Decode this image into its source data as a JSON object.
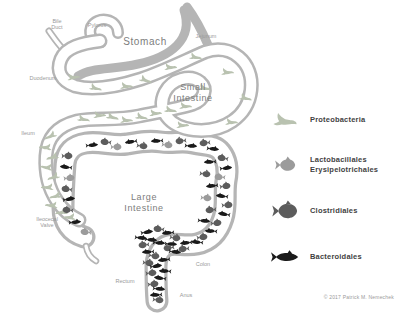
{
  "colors": {
    "tube_wall": "#b5b5b5",
    "label_text": "#9a9a9a",
    "organ_text": "#7d7d7d",
    "legend_text": "#3f3f3f"
  },
  "copyright": "© 2017 Patrick M. Nemechek",
  "legend": {
    "items": [
      {
        "id": "proteobacteria",
        "glyph": "bird",
        "color": "#b9c2b0",
        "label": "Proteobacteria"
      },
      {
        "id": "lactobacillales",
        "glyph": "fish-round",
        "color": "#9b9b9b",
        "label": "Lactobacillales\nErysipelotrichales"
      },
      {
        "id": "clostridiales",
        "glyph": "fish-round",
        "color": "#5c5c5c",
        "label": "Clostridiales"
      },
      {
        "id": "bacteroidales",
        "glyph": "fish-sleek",
        "color": "#1a1a1a",
        "label": "Bacteroidales"
      }
    ]
  },
  "labels": [
    {
      "name": "bile-duct",
      "cls": "anatomy",
      "fs": 5.5,
      "x": 57,
      "y": 23,
      "lines": [
        "Bile",
        "Duct"
      ]
    },
    {
      "name": "pylorus",
      "cls": "anatomy",
      "fs": 5.5,
      "x": 97,
      "y": 27,
      "lines": [
        "Pylorus"
      ]
    },
    {
      "name": "jejunum",
      "cls": "anatomy",
      "fs": 5.5,
      "x": 206,
      "y": 38,
      "lines": [
        "Jejunum"
      ]
    },
    {
      "name": "duodenum",
      "cls": "anatomy",
      "fs": 5.5,
      "x": 43,
      "y": 80,
      "lines": [
        "Duodenum"
      ]
    },
    {
      "name": "ileum",
      "cls": "anatomy",
      "fs": 5.5,
      "x": 28,
      "y": 135,
      "lines": [
        "Ileum"
      ]
    },
    {
      "name": "ileocecal-valve",
      "cls": "anatomy",
      "fs": 5.5,
      "x": 47,
      "y": 221,
      "lines": [
        "Ileocecal",
        "Valve"
      ]
    },
    {
      "name": "rectum",
      "cls": "anatomy",
      "fs": 5.5,
      "x": 125,
      "y": 283,
      "lines": [
        "Rectum"
      ]
    },
    {
      "name": "colon",
      "cls": "anatomy",
      "fs": 5.5,
      "x": 203,
      "y": 266,
      "lines": [
        "Colon"
      ]
    },
    {
      "name": "anus",
      "cls": "anatomy",
      "fs": 5.5,
      "x": 186,
      "y": 297,
      "lines": [
        "Anus"
      ]
    },
    {
      "name": "stomach",
      "cls": "organ",
      "fs": 10,
      "x": 145,
      "y": 45,
      "lines": [
        "Stomach"
      ]
    },
    {
      "name": "small-intestine",
      "cls": "organ",
      "fs": 9,
      "x": 193,
      "y": 90,
      "lines": [
        "Small",
        "Intestine"
      ]
    },
    {
      "name": "large-intestine",
      "cls": "organ",
      "fs": 9,
      "x": 144,
      "y": 200,
      "lines": [
        "Large",
        "Intestine"
      ]
    }
  ],
  "markers": [
    {
      "t": "p",
      "x": 74,
      "y": 77,
      "r": -12
    },
    {
      "t": "p",
      "x": 96,
      "y": 88,
      "r": 8
    },
    {
      "t": "p",
      "x": 127,
      "y": 86,
      "r": -5
    },
    {
      "t": "p",
      "x": 146,
      "y": 80,
      "r": 14
    },
    {
      "t": "p",
      "x": 171,
      "y": 67,
      "r": -8
    },
    {
      "t": "p",
      "x": 196,
      "y": 57,
      "r": 4
    },
    {
      "t": "p",
      "x": 228,
      "y": 72,
      "r": -6
    },
    {
      "t": "p",
      "x": 246,
      "y": 98,
      "r": 8
    },
    {
      "t": "p",
      "x": 232,
      "y": 122,
      "r": -5
    },
    {
      "t": "p",
      "x": 205,
      "y": 88,
      "r": 6
    },
    {
      "t": "p",
      "x": 183,
      "y": 125,
      "r": -8
    },
    {
      "t": "p",
      "x": 84,
      "y": 119,
      "r": 6
    },
    {
      "t": "p",
      "x": 100,
      "y": 115,
      "r": -8
    },
    {
      "t": "p",
      "x": 113,
      "y": 117,
      "r": 10
    },
    {
      "t": "p",
      "x": 127,
      "y": 120,
      "r": -5
    },
    {
      "t": "p",
      "x": 142,
      "y": 117,
      "r": 7
    },
    {
      "t": "p",
      "x": 156,
      "y": 113,
      "r": -9
    },
    {
      "t": "p",
      "x": 171,
      "y": 110,
      "r": 5
    },
    {
      "t": "p",
      "x": 186,
      "y": 106,
      "r": -5
    },
    {
      "t": "p",
      "x": 50,
      "y": 136,
      "r": -18,
      "f": 1
    },
    {
      "t": "p",
      "x": 45,
      "y": 147,
      "r": 10,
      "f": 1
    },
    {
      "t": "p",
      "x": 52,
      "y": 157,
      "r": -10,
      "f": 1
    },
    {
      "t": "p",
      "x": 46,
      "y": 167,
      "r": 14,
      "f": 1
    },
    {
      "t": "p",
      "x": 53,
      "y": 177,
      "r": -14,
      "f": 1
    },
    {
      "t": "p",
      "x": 47,
      "y": 187,
      "r": 8,
      "f": 1
    },
    {
      "t": "p",
      "x": 55,
      "y": 196,
      "r": -8,
      "f": 1
    },
    {
      "t": "p",
      "x": 51,
      "y": 205,
      "r": 10,
      "f": 1
    },
    {
      "t": "p",
      "x": 61,
      "y": 212,
      "r": -5,
      "f": 1
    },
    {
      "t": "p",
      "x": 69,
      "y": 217,
      "r": 6,
      "f": 1
    },
    {
      "t": "c",
      "x": 68,
      "y": 156,
      "r": 0
    },
    {
      "t": "b",
      "x": 65,
      "y": 167,
      "r": 6,
      "f": 1
    },
    {
      "t": "l",
      "x": 70,
      "y": 178,
      "r": -6
    },
    {
      "t": "c",
      "x": 66,
      "y": 189,
      "r": 8,
      "f": 1
    },
    {
      "t": "b",
      "x": 70,
      "y": 199,
      "r": -8
    },
    {
      "t": "c",
      "x": 67,
      "y": 210,
      "r": 5,
      "f": 1
    },
    {
      "t": "b",
      "x": 76,
      "y": 222,
      "r": -5
    },
    {
      "t": "l",
      "x": 85,
      "y": 232,
      "r": 6,
      "f": 1
    },
    {
      "t": "b",
      "x": 93,
      "y": 145,
      "r": -5
    },
    {
      "t": "c",
      "x": 105,
      "y": 142,
      "r": 6,
      "f": 1
    },
    {
      "t": "l",
      "x": 117,
      "y": 147,
      "r": 0
    },
    {
      "t": "b",
      "x": 130,
      "y": 142,
      "r": -8,
      "f": 1
    },
    {
      "t": "c",
      "x": 143,
      "y": 146,
      "r": 6
    },
    {
      "t": "b",
      "x": 156,
      "y": 141,
      "r": -4,
      "f": 1
    },
    {
      "t": "l",
      "x": 168,
      "y": 145,
      "r": 5
    },
    {
      "t": "c",
      "x": 180,
      "y": 141,
      "r": -6,
      "f": 1
    },
    {
      "t": "b",
      "x": 192,
      "y": 146,
      "r": 4
    },
    {
      "t": "c",
      "x": 204,
      "y": 143,
      "r": -5,
      "f": 1
    },
    {
      "t": "b",
      "x": 214,
      "y": 149,
      "r": 6
    },
    {
      "t": "c",
      "x": 222,
      "y": 158,
      "r": 10,
      "f": 1
    },
    {
      "t": "b",
      "x": 227,
      "y": 168,
      "r": -6
    },
    {
      "t": "l",
      "x": 219,
      "y": 177,
      "r": 4,
      "f": 1
    },
    {
      "t": "c",
      "x": 226,
      "y": 186,
      "r": -8
    },
    {
      "t": "b",
      "x": 221,
      "y": 196,
      "r": 6,
      "f": 1
    },
    {
      "t": "c",
      "x": 228,
      "y": 205,
      "r": -4
    },
    {
      "t": "b",
      "x": 223,
      "y": 214,
      "r": 8,
      "f": 1
    },
    {
      "t": "c",
      "x": 217,
      "y": 223,
      "r": -6
    },
    {
      "t": "b",
      "x": 210,
      "y": 231,
      "r": 4,
      "f": 1
    },
    {
      "t": "c",
      "x": 203,
      "y": 237,
      "r": -8
    },
    {
      "t": "b",
      "x": 196,
      "y": 242,
      "r": 5,
      "f": 1
    },
    {
      "t": "b",
      "x": 209,
      "y": 162,
      "r": -4,
      "f": 1
    },
    {
      "t": "c",
      "x": 206,
      "y": 174,
      "r": 6
    },
    {
      "t": "b",
      "x": 211,
      "y": 186,
      "r": -6,
      "f": 1
    },
    {
      "t": "l",
      "x": 207,
      "y": 198,
      "r": 4
    },
    {
      "t": "c",
      "x": 210,
      "y": 210,
      "r": -5,
      "f": 1
    },
    {
      "t": "b",
      "x": 205,
      "y": 221,
      "r": 5
    },
    {
      "t": "b",
      "x": 148,
      "y": 232,
      "r": -8
    },
    {
      "t": "c",
      "x": 158,
      "y": 229,
      "r": 6,
      "f": 1
    },
    {
      "t": "b",
      "x": 167,
      "y": 233,
      "r": -5,
      "f": 1
    },
    {
      "t": "c",
      "x": 176,
      "y": 238,
      "r": 8
    },
    {
      "t": "b",
      "x": 185,
      "y": 243,
      "r": -6,
      "f": 1
    },
    {
      "t": "b",
      "x": 152,
      "y": 240,
      "r": 5
    },
    {
      "t": "c",
      "x": 143,
      "y": 245,
      "r": -5,
      "f": 1
    },
    {
      "t": "b",
      "x": 160,
      "y": 243,
      "r": 4
    },
    {
      "t": "c",
      "x": 168,
      "y": 248,
      "r": -7,
      "f": 1
    },
    {
      "t": "b",
      "x": 176,
      "y": 252,
      "r": 6
    },
    {
      "t": "b",
      "x": 147,
      "y": 252,
      "r": -4,
      "f": 1
    },
    {
      "t": "c",
      "x": 155,
      "y": 256,
      "r": 8
    },
    {
      "t": "b",
      "x": 163,
      "y": 260,
      "r": -6,
      "f": 1
    },
    {
      "t": "c",
      "x": 149,
      "y": 263,
      "r": 5
    },
    {
      "t": "b",
      "x": 157,
      "y": 266,
      "r": -8
    },
    {
      "t": "b",
      "x": 164,
      "y": 271,
      "r": 4,
      "f": 1
    },
    {
      "t": "c",
      "x": 152,
      "y": 273,
      "r": -5
    },
    {
      "t": "b",
      "x": 159,
      "y": 278,
      "r": 7,
      "f": 1
    },
    {
      "t": "c",
      "x": 154,
      "y": 284,
      "r": -6
    },
    {
      "t": "b",
      "x": 160,
      "y": 289,
      "r": 5
    },
    {
      "t": "b",
      "x": 155,
      "y": 295,
      "r": -4,
      "f": 1
    },
    {
      "t": "c",
      "x": 159,
      "y": 300,
      "r": 6
    },
    {
      "t": "b",
      "x": 172,
      "y": 244,
      "r": 3
    },
    {
      "t": "c",
      "x": 183,
      "y": 249,
      "r": -5,
      "f": 1
    },
    {
      "t": "b",
      "x": 142,
      "y": 238,
      "r": 6
    }
  ]
}
